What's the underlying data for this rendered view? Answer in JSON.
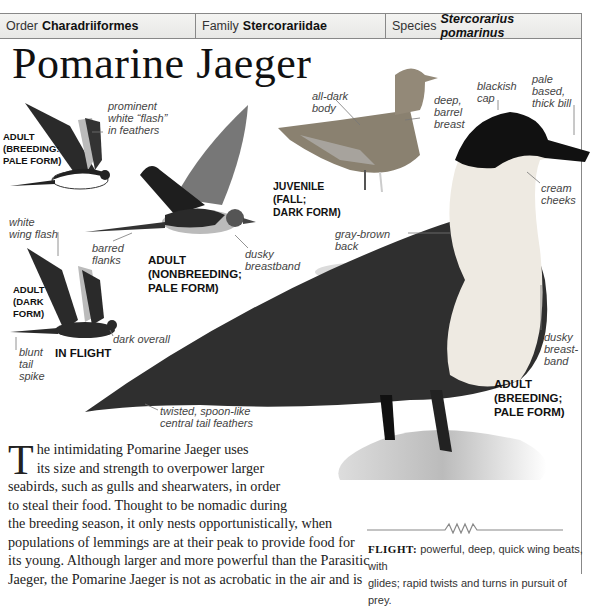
{
  "header": {
    "order_label": "Order",
    "order_value": "Charadriiformes",
    "family_label": "Family",
    "family_value": "Stercorariidae",
    "species_label": "Species",
    "species_value": "Stercorarius pomarinus"
  },
  "title": "Pomarine Jaeger",
  "illustrations": [
    {
      "caption": [
        "ADULT",
        "(BREEDING:",
        "PALE FORM)"
      ],
      "annotations": [
        "prominent white “flash” in feathers"
      ]
    },
    {
      "caption": [
        "ADULT",
        "(NONBREEDING;",
        "PALE FORM)"
      ],
      "annotations": [
        "barred flanks",
        "dusky breastband"
      ]
    },
    {
      "caption": [
        "ADULT",
        "(DARK",
        "FORM)"
      ],
      "annotations": [
        "white wing flash",
        "dark overall",
        "blunt tail spike"
      ]
    },
    {
      "caption": [
        "JUVENILE",
        "(FALL;",
        "DARK FORM)"
      ],
      "annotations": [
        "all-dark body",
        "deep, barrel breast"
      ]
    },
    {
      "caption": [
        "ADULT",
        "(BREEDING;",
        "PALE FORM)"
      ],
      "annotations": [
        "blackish cap",
        "pale based, thick bill",
        "cream cheeks",
        "gray-brown back",
        "dusky breast-band",
        "twisted, spoon-like central tail feathers"
      ]
    }
  ],
  "in_flight_label": "IN FLIGHT",
  "labels": {
    "prominent": [
      "prominent",
      "white “flash”",
      "in feathers"
    ],
    "adult_breeding_pale": [
      "ADULT",
      "(BREEDING:",
      "PALE FORM)"
    ],
    "all_dark": [
      "all-dark",
      "body"
    ],
    "deep_barrel": [
      "deep,",
      "barrel",
      "breast"
    ],
    "blackish_cap": [
      "blackish",
      "cap"
    ],
    "pale_bill": [
      "pale",
      "based,",
      "thick bill"
    ],
    "cream_cheeks": [
      "cream",
      "cheeks"
    ],
    "juvenile": [
      "JUVENILE",
      "(FALL;",
      "DARK FORM)"
    ],
    "white_wing_flash": [
      "white",
      "wing flash"
    ],
    "barred_flanks": [
      "barred",
      "flanks"
    ],
    "adult_nonbreeding": [
      "ADULT",
      "(NONBREEDING;",
      "PALE FORM)"
    ],
    "dusky_breastband": [
      "dusky",
      "breastband"
    ],
    "gray_brown_back": [
      "gray-brown",
      "back"
    ],
    "adult_dark": [
      "ADULT",
      "(DARK",
      "FORM)"
    ],
    "dark_overall": "dark overall",
    "blunt_tail": [
      "blunt",
      "tail",
      "spike"
    ],
    "dusky_breast_band": [
      "dusky",
      "breast-",
      "band"
    ],
    "adult_breeding_main": [
      "ADULT",
      "(BREEDING;",
      "PALE FORM)"
    ],
    "tail_feathers": [
      "twisted, spoon-like",
      "central tail feathers"
    ]
  },
  "body": {
    "dropcap": "T",
    "lines": [
      "he intimidating Pomarine Jaeger uses",
      "its size and strength to overpower larger",
      "seabirds, such as gulls and shearwaters, in order",
      "to steal their food. Thought to be nomadic during",
      "the breeding season, it only nests opportunistically, when",
      "populations of lemmings are at their peak to provide food for",
      "its young. Although larger and more powerful than the Parasitic",
      "Jaeger, the Pomarine Jaeger is not as acrobatic in the air and is"
    ]
  },
  "flight": {
    "label": "FLIGHT:",
    "text_line1": " powerful, deep, quick wing beats, with",
    "text_line2": "glides; rapid twists and turns in pursuit of prey."
  }
}
